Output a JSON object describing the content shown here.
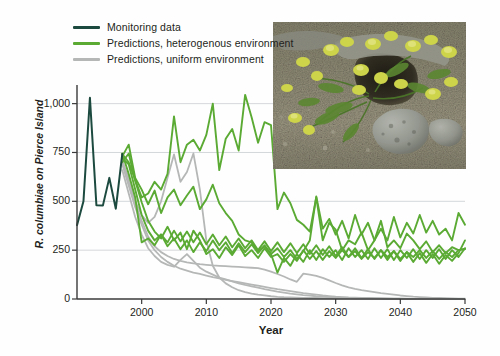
{
  "figure": {
    "ylabel": "R. columbiae on Pierce Island",
    "xlabel": "Year"
  },
  "legend": {
    "items": [
      {
        "label": "Monitoring data",
        "color": "#1d4a3f",
        "key": "monitoring"
      },
      {
        "label": "Predictions, heterogenous environment",
        "color": "#5aaa34",
        "key": "heterogenous"
      },
      {
        "label": "Predictions, uniform environment",
        "color": "#b5b7b6",
        "key": "uniform"
      }
    ]
  },
  "inset_photo": {
    "alt": "Ranunculus columbiae plants with yellow flowers growing on rocky gravel ground"
  },
  "chart_data": {
    "type": "line",
    "title": "",
    "xlabel": "Year",
    "ylabel": "R. columbiae on Pierce Island",
    "xlim": [
      1990,
      2050
    ],
    "ylim": [
      0,
      1080
    ],
    "xticks": [
      2000,
      2010,
      2020,
      2030,
      2040,
      2050
    ],
    "xticklabels": [
      "2000",
      "2010",
      "2020",
      "2030",
      "2040",
      "2050"
    ],
    "yticks": [
      0,
      250,
      500,
      750,
      1000
    ],
    "yticklabels": [
      "0",
      "250",
      "500",
      "750",
      "1,000"
    ],
    "grid": "horizontal",
    "legend_position": "top-left",
    "series": [
      {
        "name": "Monitoring data",
        "group": "monitoring",
        "color": "#1d4a3f",
        "x": [
          1990,
          1991,
          1992,
          1993,
          1994,
          1995,
          1996,
          1997
        ],
        "values": [
          378,
          500,
          1030,
          480,
          478,
          620,
          462,
          742
        ]
      },
      {
        "name": "Predictions, heterogenous environment 1",
        "group": "heterogenous",
        "color": "#5aaa34",
        "x": [
          1997,
          1998,
          1999,
          2000,
          2001,
          2002,
          2003,
          2004,
          2005,
          2006,
          2007,
          2008,
          2009,
          2010,
          2011,
          2012,
          2013,
          2014,
          2015,
          2016,
          2017,
          2018,
          2019,
          2020,
          2021,
          2022,
          2023,
          2024,
          2025,
          2026,
          2027,
          2028,
          2029,
          2030,
          2031,
          2032,
          2033,
          2034,
          2035,
          2036,
          2037,
          2038,
          2039,
          2040,
          2041,
          2042,
          2043,
          2044,
          2045,
          2046,
          2047,
          2048,
          2049,
          2050
        ],
        "values": [
          742,
          700,
          610,
          520,
          540,
          600,
          560,
          640,
          935,
          700,
          790,
          815,
          760,
          840,
          1000,
          660,
          820,
          870,
          760,
          1045,
          930,
          800,
          905,
          890,
          460,
          545,
          490,
          405,
          380,
          345,
          520,
          300,
          390,
          355,
          250,
          300,
          280,
          340,
          250,
          300,
          400,
          265,
          300,
          260,
          335,
          300,
          255,
          295,
          240,
          275,
          235,
          265,
          250,
          258
        ]
      },
      {
        "name": "Predictions, heterogenous environment 2",
        "group": "heterogenous",
        "color": "#5aaa34",
        "x": [
          1997,
          1998,
          1999,
          2000,
          2001,
          2002,
          2003,
          2004,
          2005,
          2006,
          2007,
          2008,
          2009,
          2010,
          2011,
          2012,
          2013,
          2014,
          2015,
          2016,
          2017,
          2018,
          2019,
          2020,
          2021,
          2022,
          2023,
          2024,
          2025,
          2026,
          2027,
          2028,
          2029,
          2030,
          2031,
          2032,
          2033,
          2034,
          2035,
          2036,
          2037,
          2038,
          2039,
          2040,
          2041,
          2042,
          2043,
          2044,
          2045,
          2046,
          2047,
          2048,
          2049,
          2050
        ],
        "values": [
          730,
          790,
          620,
          560,
          485,
          555,
          440,
          520,
          560,
          480,
          530,
          575,
          460,
          510,
          585,
          490,
          440,
          400,
          330,
          300,
          290,
          245,
          270,
          230,
          260,
          215,
          250,
          205,
          245,
          300,
          525,
          360,
          410,
          330,
          400,
          310,
          430,
          330,
          390,
          300,
          360,
          300,
          420,
          315,
          390,
          335,
          430,
          340,
          400,
          330,
          360,
          300,
          440,
          380
        ]
      },
      {
        "name": "Predictions, heterogenous environment 3",
        "group": "heterogenous",
        "color": "#5aaa34",
        "x": [
          1997,
          1998,
          1999,
          2000,
          2001,
          2002,
          2003,
          2004,
          2005,
          2006,
          2007,
          2008,
          2009,
          2010,
          2011,
          2012,
          2013,
          2014,
          2015,
          2016,
          2017,
          2018,
          2019,
          2020,
          2021,
          2022,
          2023,
          2024,
          2025,
          2026,
          2027,
          2028,
          2029,
          2030,
          2031,
          2032,
          2033,
          2034,
          2035,
          2036,
          2037,
          2038,
          2039,
          2040,
          2041,
          2042,
          2043,
          2044,
          2045,
          2046,
          2047,
          2048,
          2049,
          2050
        ],
        "values": [
          700,
          745,
          605,
          495,
          400,
          345,
          310,
          370,
          300,
          340,
          255,
          350,
          300,
          230,
          255,
          210,
          265,
          225,
          275,
          220,
          250,
          210,
          260,
          215,
          230,
          190,
          230,
          195,
          250,
          205,
          245,
          200,
          245,
          210,
          250,
          215,
          245,
          205,
          240,
          210,
          250,
          215,
          245,
          205,
          240,
          215,
          250,
          210,
          245,
          205,
          240,
          215,
          250,
          255
        ]
      },
      {
        "name": "Predictions, heterogenous environment 4",
        "group": "heterogenous",
        "color": "#5aaa34",
        "x": [
          1997,
          1998,
          1999,
          2000,
          2001,
          2002,
          2003,
          2004,
          2005,
          2006,
          2007,
          2008,
          2009,
          2010,
          2011,
          2012,
          2013,
          2014,
          2015,
          2016,
          2017,
          2018,
          2019,
          2020,
          2021,
          2022,
          2023,
          2024,
          2025,
          2026,
          2027,
          2028,
          2029,
          2030,
          2031,
          2032,
          2033,
          2034,
          2035,
          2036,
          2037,
          2038,
          2039,
          2040,
          2041,
          2042,
          2043,
          2044,
          2045,
          2046,
          2047,
          2048,
          2049,
          2050
        ],
        "values": [
          720,
          690,
          560,
          430,
          350,
          300,
          330,
          270,
          310,
          255,
          300,
          240,
          290,
          245,
          300,
          250,
          290,
          235,
          285,
          240,
          280,
          235,
          275,
          230,
          135,
          210,
          170,
          230,
          190,
          250,
          200,
          255,
          215,
          250,
          200,
          260,
          215,
          250,
          205,
          260,
          210,
          255,
          200,
          250,
          210,
          255,
          205,
          250,
          210,
          255,
          205,
          250,
          215,
          260
        ]
      },
      {
        "name": "Predictions, heterogenous environment 5",
        "group": "heterogenous",
        "color": "#5aaa34",
        "x": [
          1997,
          1998,
          1999,
          2000,
          2001,
          2002,
          2003,
          2004,
          2005,
          2006,
          2007,
          2008,
          2009,
          2010,
          2011,
          2012,
          2013,
          2014,
          2015,
          2016,
          2017,
          2018,
          2019,
          2020,
          2021,
          2022,
          2023,
          2024,
          2025,
          2026,
          2027,
          2028,
          2029,
          2030,
          2031,
          2032,
          2033,
          2034,
          2035,
          2036,
          2037,
          2038,
          2039,
          2040,
          2041,
          2042,
          2043,
          2044,
          2045,
          2046,
          2047,
          2048,
          2049,
          2050
        ],
        "values": [
          745,
          640,
          520,
          290,
          310,
          275,
          330,
          290,
          350,
          295,
          345,
          290,
          340,
          280,
          330,
          275,
          320,
          265,
          310,
          260,
          300,
          250,
          295,
          245,
          290,
          240,
          285,
          235,
          280,
          230,
          275,
          225,
          270,
          220,
          265,
          215,
          260,
          210,
          255,
          205,
          250,
          200,
          245,
          195,
          240,
          190,
          235,
          185,
          230,
          180,
          225,
          195,
          235,
          300
        ]
      },
      {
        "name": "Predictions, uniform environment 1",
        "group": "uniform",
        "color": "#b5b7b6",
        "x": [
          1997,
          1998,
          1999,
          2000,
          2001,
          2002,
          2003,
          2004,
          2005,
          2006,
          2007,
          2008,
          2009,
          2010,
          2011,
          2012,
          2013,
          2014,
          2015,
          2016,
          2017,
          2018,
          2019,
          2020,
          2021,
          2022,
          2023,
          2024,
          2025,
          2026,
          2027,
          2028,
          2029,
          2030,
          2031,
          2032,
          2033,
          2034,
          2035,
          2036,
          2037,
          2038,
          2039,
          2040,
          2041,
          2042,
          2043,
          2044,
          2045,
          2046,
          2047,
          2048,
          2049,
          2050
        ],
        "values": [
          700,
          620,
          500,
          430,
          390,
          420,
          500,
          620,
          740,
          600,
          650,
          745,
          560,
          300,
          170,
          110,
          80,
          60,
          45,
          35,
          28,
          22,
          18,
          14,
          11,
          9,
          8,
          7,
          6,
          5,
          5,
          4,
          4,
          3,
          3,
          3,
          2,
          2,
          2,
          2,
          2,
          1,
          1,
          1,
          1,
          1,
          1,
          1,
          1,
          1,
          1,
          1,
          1,
          1
        ]
      },
      {
        "name": "Predictions, uniform environment 2",
        "group": "uniform",
        "color": "#b5b7b6",
        "x": [
          1997,
          1998,
          1999,
          2000,
          2001,
          2002,
          2003,
          2004,
          2005,
          2006,
          2007,
          2008,
          2009,
          2010,
          2011,
          2012,
          2013,
          2014,
          2015,
          2016,
          2017,
          2018,
          2019,
          2020,
          2021,
          2022,
          2023,
          2024,
          2025,
          2026,
          2027,
          2028,
          2029,
          2030,
          2031,
          2032,
          2033,
          2034,
          2035,
          2036,
          2037,
          2038,
          2039,
          2040,
          2041,
          2042,
          2043,
          2044,
          2045,
          2046,
          2047,
          2048,
          2049,
          2050
        ],
        "values": [
          660,
          540,
          420,
          330,
          260,
          220,
          190,
          175,
          165,
          200,
          230,
          195,
          160,
          140,
          125,
          110,
          100,
          90,
          80,
          72,
          65,
          58,
          50,
          44,
          38,
          33,
          28,
          24,
          20,
          17,
          14,
          12,
          10,
          8,
          7,
          6,
          5,
          4,
          4,
          3,
          3,
          2,
          2,
          2,
          1,
          1,
          1,
          1,
          1,
          1,
          1,
          1,
          1,
          1
        ]
      },
      {
        "name": "Predictions, uniform environment 3",
        "group": "uniform",
        "color": "#b5b7b6",
        "x": [
          1997,
          1998,
          1999,
          2000,
          2001,
          2002,
          2003,
          2004,
          2005,
          2006,
          2007,
          2008,
          2009,
          2010,
          2011,
          2012,
          2013,
          2014,
          2015,
          2016,
          2017,
          2018,
          2019,
          2020,
          2021,
          2022,
          2023,
          2024,
          2025,
          2026,
          2027,
          2028,
          2029,
          2030,
          2031,
          2032,
          2033,
          2034,
          2035,
          2036,
          2037,
          2038,
          2039,
          2040,
          2041,
          2042,
          2043,
          2044,
          2045,
          2046,
          2047,
          2048,
          2049,
          2050
        ],
        "values": [
          690,
          580,
          470,
          380,
          300,
          250,
          215,
          190,
          170,
          155,
          145,
          135,
          128,
          120,
          112,
          105,
          98,
          92,
          86,
          80,
          74,
          68,
          62,
          56,
          50,
          45,
          40,
          35,
          30,
          26,
          22,
          18,
          15,
          12,
          10,
          8,
          7,
          6,
          5,
          4,
          3,
          3,
          2,
          2,
          2,
          1,
          1,
          1,
          1,
          1,
          1,
          1,
          1,
          1
        ]
      },
      {
        "name": "Predictions, uniform environment 4",
        "group": "uniform",
        "color": "#b5b7b6",
        "x": [
          1997,
          1998,
          1999,
          2000,
          2001,
          2002,
          2003,
          2004,
          2005,
          2006,
          2007,
          2008,
          2009,
          2010,
          2011,
          2012,
          2013,
          2014,
          2015,
          2016,
          2017,
          2018,
          2019,
          2020,
          2021,
          2022,
          2023,
          2024,
          2025,
          2026,
          2027,
          2028,
          2029,
          2030,
          2031,
          2032,
          2033,
          2034,
          2035,
          2036,
          2037,
          2038,
          2039,
          2040,
          2041,
          2042,
          2043,
          2044,
          2045,
          2046,
          2047,
          2048,
          2049,
          2050
        ],
        "values": [
          710,
          600,
          490,
          400,
          320,
          270,
          240,
          220,
          205,
          195,
          188,
          182,
          178,
          175,
          172,
          170,
          168,
          166,
          164,
          162,
          160,
          158,
          150,
          140,
          128,
          115,
          100,
          88,
          130,
          125,
          118,
          108,
          95,
          82,
          70,
          60,
          52,
          45,
          40,
          35,
          30,
          26,
          22,
          18,
          15,
          12,
          10,
          8,
          6,
          5,
          4,
          3,
          2,
          2
        ]
      }
    ]
  }
}
